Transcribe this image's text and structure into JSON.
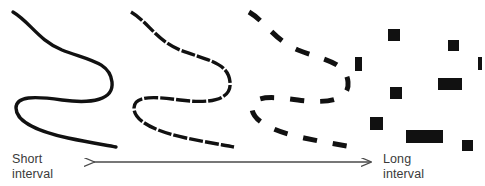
{
  "figure": {
    "width": 485,
    "height": 186,
    "background_color": "#ffffff",
    "ink_color": "#111111",
    "arrow_color": "#4a4a4a",
    "text_color": "#3a3a3a"
  },
  "axis": {
    "left_label": "Short\ninterval",
    "right_label": "Long\ninterval",
    "arrow_name": "double-headed-arrow",
    "arrow_x_start": 94,
    "arrow_x_end": 371,
    "arrow_y": 162
  },
  "chart_data": {
    "type": "diagram",
    "title": "",
    "categories": [
      "continuous",
      "slightly-fragmented",
      "fragmented",
      "scattered"
    ],
    "panels": [
      {
        "name": "panel-continuous",
        "index": 0,
        "interval": "short",
        "fragmentation": 0,
        "stroke_width": 3.4,
        "dash_pattern": "none",
        "path": "M 13 12 C 30 22 38 40 62 50 C 88 60 110 62 112 82 C 114 100 92 104 62 100 C 34 96 16 96 16 108 C 16 122 40 132 68 138 C 92 143 106 145 116 147"
      },
      {
        "name": "panel-slightly-fragmented",
        "index": 1,
        "interval": "short-medium",
        "fragmentation": 1,
        "stroke_width": 3.4,
        "dash_pattern": "14 2",
        "path": "M 131 12 C 148 22 156 40 180 50 C 206 60 228 62 230 82 C 232 100 210 104 180 100 C 152 96 134 96 134 108 C 134 122 158 132 186 138 C 210 143 224 145 234 147"
      },
      {
        "name": "panel-fragmented",
        "index": 2,
        "interval": "medium-long",
        "fragmentation": 2,
        "stroke_width": 5.0,
        "dash_pattern": "14 16",
        "path": "M 249 12 C 266 22 274 40 298 50 C 324 60 346 62 348 82 C 350 100 328 104 298 100 C 270 96 252 96 252 108 C 252 122 276 132 304 138 C 328 143 342 145 352 147"
      },
      {
        "name": "panel-scattered",
        "index": 3,
        "interval": "long",
        "fragmentation": 3,
        "stroke_width": 0,
        "dash_pattern": "scattered-blocks",
        "blocks": [
          {
            "x": 388,
            "y": 29,
            "w": 12,
            "h": 12
          },
          {
            "x": 448,
            "y": 40,
            "w": 11,
            "h": 11
          },
          {
            "x": 355,
            "y": 57,
            "w": 7,
            "h": 14
          },
          {
            "x": 478,
            "y": 57,
            "w": 4,
            "h": 13
          },
          {
            "x": 438,
            "y": 78,
            "w": 24,
            "h": 12
          },
          {
            "x": 390,
            "y": 87,
            "w": 12,
            "h": 12
          },
          {
            "x": 370,
            "y": 117,
            "w": 13,
            "h": 13
          },
          {
            "x": 406,
            "y": 130,
            "w": 37,
            "h": 13
          },
          {
            "x": 462,
            "y": 140,
            "w": 11,
            "h": 11
          }
        ]
      }
    ]
  }
}
